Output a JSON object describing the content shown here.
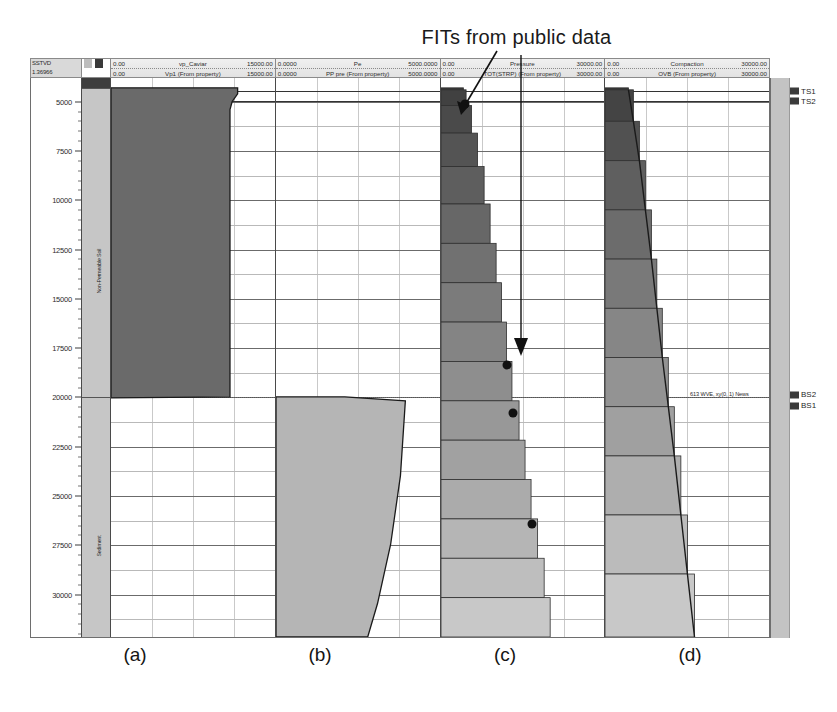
{
  "figure": {
    "title": "FITs from public data",
    "panel_labels": [
      "(a)",
      "(b)",
      "(c)",
      "(d)"
    ]
  },
  "header": {
    "depth_col": {
      "line1": "SSTVD",
      "line2": "1.36966"
    },
    "tracks": [
      {
        "row1": {
          "low": "0.00",
          "name": "vp_Caviar",
          "high": "15000.00"
        },
        "row2": {
          "low": "0.00",
          "name": "Vp1 (From property)",
          "high": "15000.00"
        }
      },
      {
        "row1": {
          "low": "0.0000",
          "name": "Pe",
          "high": "5000.0000"
        },
        "row2": {
          "low": "0.0000",
          "name": "PP pre (From property)",
          "high": "5000.0000"
        }
      },
      {
        "row1": {
          "low": "0.00",
          "name": "Pressure",
          "high": "30000.00"
        },
        "row2": {
          "low": "0.00",
          "name": "TOT(STRP) (From property)",
          "high": "30000.00"
        }
      },
      {
        "row1": {
          "low": "0.00",
          "name": "Compaction",
          "high": "30000.00"
        },
        "row2": {
          "low": "0.00",
          "name": "OVB (From property)",
          "high": "30000.00"
        }
      }
    ]
  },
  "depth_axis": {
    "unit_label": "SSTVD",
    "ticks": [
      5000,
      7500,
      10000,
      12500,
      15000,
      17500,
      20000,
      22500,
      25000,
      27500,
      30000
    ],
    "min": 3800,
    "max": 32200
  },
  "lithology": {
    "units": [
      {
        "label": "Non-Permeable Soil",
        "top": 4300,
        "base": 20000,
        "shade": "#c6c6c6"
      },
      {
        "label": "Sediment",
        "top": 20000,
        "base": 32200,
        "shade": "#c6c6c6"
      }
    ]
  },
  "surfaces": [
    {
      "name": "TS1",
      "depth": 4450
    },
    {
      "name": "TS2",
      "depth": 4950
    },
    {
      "name": "BS2",
      "depth": 19850
    },
    {
      "name": "BS1",
      "depth": 20400
    }
  ],
  "annotations": {
    "bs_note": "613  WVE, xy(0, 1) News"
  },
  "chart_data": {
    "type": "area",
    "title": "FITs from public data",
    "ylabel": "SSTVD (ft)",
    "ylim": [
      3800,
      32200
    ],
    "y_ticks": [
      5000,
      7500,
      10000,
      12500,
      15000,
      17500,
      20000,
      22500,
      25000,
      27500,
      30000
    ],
    "grid": true,
    "panels": [
      {
        "id": "a",
        "label": "(a)",
        "curve": "Vp1 (From property)",
        "xlabel": "vp_Caviar",
        "xlim": [
          0,
          15000
        ],
        "points": [
          {
            "depth": 4300,
            "value": 11600
          },
          {
            "depth": 4600,
            "value": 11600
          },
          {
            "depth": 5000,
            "value": 11100
          },
          {
            "depth": 5400,
            "value": 10900
          },
          {
            "depth": 20000,
            "value": 10900
          },
          {
            "depth": 20050,
            "value": 0
          }
        ]
      },
      {
        "id": "b",
        "label": "(b)",
        "curve": "PP pre (From property)",
        "xlabel": "Pe",
        "xlim": [
          0,
          5000
        ],
        "points": [
          {
            "depth": 20000,
            "value": 2100
          },
          {
            "depth": 20200,
            "value": 3950
          },
          {
            "depth": 24000,
            "value": 3800
          },
          {
            "depth": 27500,
            "value": 3500
          },
          {
            "depth": 30500,
            "value": 3100
          },
          {
            "depth": 32200,
            "value": 2800
          }
        ]
      },
      {
        "id": "c",
        "label": "(c)",
        "curve": "TOT(STRP) (From property)",
        "xlabel": "Pressure",
        "xlim": [
          0,
          30000
        ],
        "points": [
          {
            "depth": 4400,
            "value": 4100
          },
          {
            "depth": 5200,
            "value": 4600
          },
          {
            "depth": 6600,
            "value": 5600
          },
          {
            "depth": 8300,
            "value": 6700
          },
          {
            "depth": 10200,
            "value": 7900
          },
          {
            "depth": 12200,
            "value": 9000
          },
          {
            "depth": 14200,
            "value": 10100
          },
          {
            "depth": 16200,
            "value": 11100
          },
          {
            "depth": 18200,
            "value": 12000
          },
          {
            "depth": 20200,
            "value": 13000
          },
          {
            "depth": 22200,
            "value": 14300
          },
          {
            "depth": 24200,
            "value": 15400
          },
          {
            "depth": 26200,
            "value": 16500
          },
          {
            "depth": 28200,
            "value": 17700
          },
          {
            "depth": 30200,
            "value": 18900
          },
          {
            "depth": 32200,
            "value": 20000
          }
        ]
      },
      {
        "id": "d",
        "label": "(d)",
        "curve": "OVB (From property)",
        "xlabel": "Compaction",
        "xlim": [
          0,
          30000
        ],
        "points": [
          {
            "depth": 4400,
            "value": 4300
          },
          {
            "depth": 6000,
            "value": 5200
          },
          {
            "depth": 8000,
            "value": 6300
          },
          {
            "depth": 10500,
            "value": 7400
          },
          {
            "depth": 13000,
            "value": 8500
          },
          {
            "depth": 15500,
            "value": 9500
          },
          {
            "depth": 18000,
            "value": 10500
          },
          {
            "depth": 20500,
            "value": 11600
          },
          {
            "depth": 23000,
            "value": 12700
          },
          {
            "depth": 26000,
            "value": 13900
          },
          {
            "depth": 29000,
            "value": 15100
          },
          {
            "depth": 32200,
            "value": 16400
          }
        ]
      }
    ],
    "fit_markers": [
      {
        "panel": "c",
        "depth": 5100,
        "value": 4500
      },
      {
        "panel": "c",
        "depth": 18350,
        "value": 12250
      },
      {
        "panel": "c",
        "depth": 20800,
        "value": 13350
      },
      {
        "panel": "c",
        "depth": 26400,
        "value": 16800
      }
    ],
    "callout": {
      "text": "FITs from public data",
      "targets": [
        "shallow FIT marker",
        "deep FIT markers"
      ]
    }
  }
}
